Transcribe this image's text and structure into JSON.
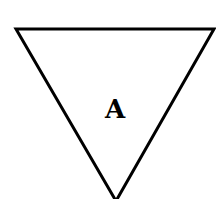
{
  "diagram": {
    "shape": "inverted-triangle",
    "label": "A",
    "stroke_color": "#000000",
    "fill_color": "#ffffff"
  }
}
